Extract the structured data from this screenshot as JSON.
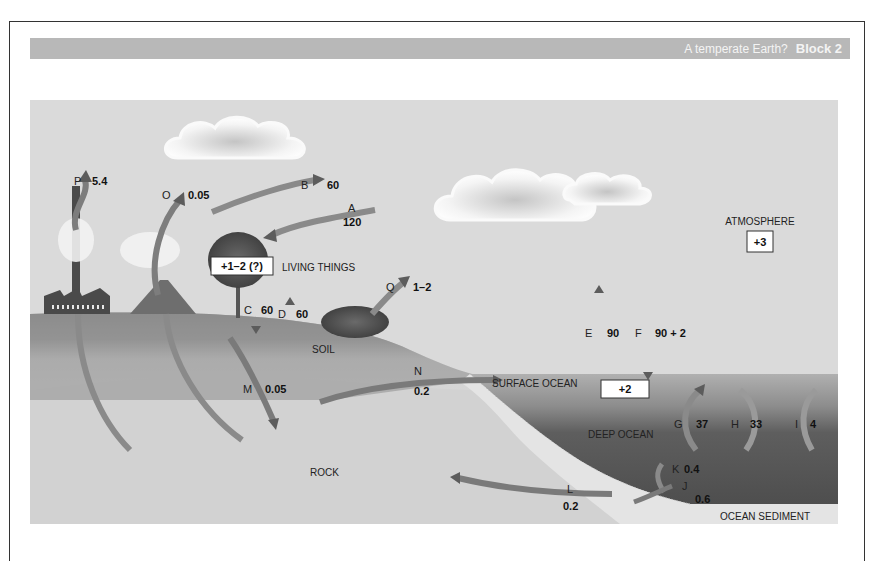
{
  "header": {
    "title": "A temperate Earth?",
    "block": "Block 2"
  },
  "regions": {
    "atmosphere": "ATMOSPHERE",
    "living_things": "LIVING THINGS",
    "soil": "SOIL",
    "surface_ocean": "SURFACE OCEAN",
    "deep_ocean": "DEEP OCEAN",
    "rock": "ROCK",
    "ocean_sediment": "OCEAN SEDIMENT"
  },
  "boxes": {
    "atmosphere_change": "+3",
    "living_things_change": "+1–2 (?)",
    "surface_ocean_change": "+2"
  },
  "fluxes": [
    {
      "label": "A",
      "value": "120"
    },
    {
      "label": "B",
      "value": "60"
    },
    {
      "label": "C",
      "value": "60"
    },
    {
      "label": "D",
      "value": "60"
    },
    {
      "label": "E",
      "value": "90"
    },
    {
      "label": "F",
      "value": "90 + 2"
    },
    {
      "label": "G",
      "value": "37"
    },
    {
      "label": "H",
      "value": "33"
    },
    {
      "label": "I",
      "value": "4"
    },
    {
      "label": "J",
      "value": "0.6"
    },
    {
      "label": "K",
      "value": "0.4"
    },
    {
      "label": "L",
      "value": "0.2"
    },
    {
      "label": "M",
      "value": "0.05"
    },
    {
      "label": "N",
      "value": "0.2"
    },
    {
      "label": "O",
      "value": "0.05"
    },
    {
      "label": "P",
      "value": "5.4"
    },
    {
      "label": "Q",
      "value": "1–2"
    }
  ],
  "colors": {
    "sky": "#dcdcdc",
    "land": "#8e8e8e",
    "rock": "#d4d4d4",
    "surface_ocean": "#a8a8a8",
    "deep_ocean": "#5a5a5a",
    "sediment": "#e6e6e6",
    "arrow": "#7a7a7a",
    "header_bar": "#b8b8b8"
  }
}
